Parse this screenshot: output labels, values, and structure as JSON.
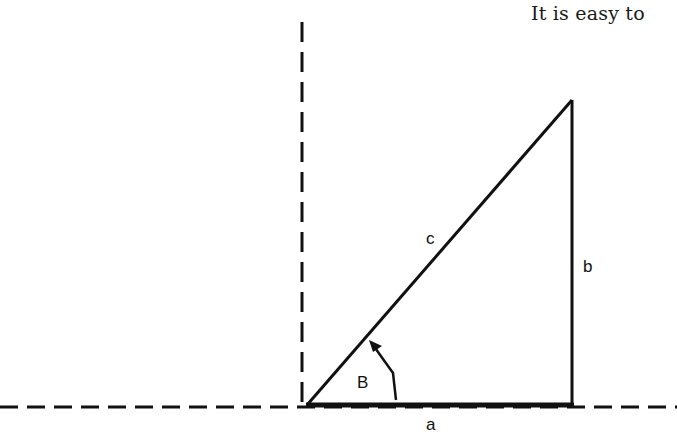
{
  "caption": "It is easy to",
  "diagram": {
    "type": "right-triangle",
    "labels": {
      "side_a": "a",
      "side_b": "b",
      "side_c": "c",
      "angle_B": "B"
    },
    "colors": {
      "stroke": "#111111",
      "background": "#ffffff"
    }
  }
}
